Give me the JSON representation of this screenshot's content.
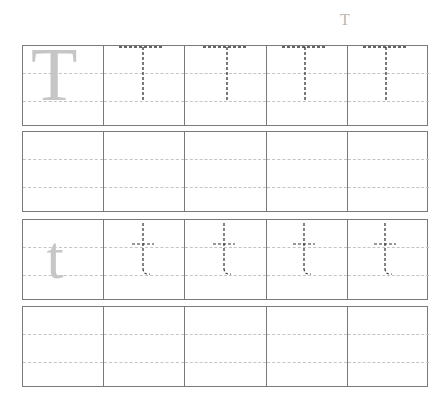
{
  "worksheet": {
    "title_letter": "T",
    "rows": [
      {
        "type": "trace",
        "model_letter": "T",
        "trace_letter": "T",
        "trace_count": 4
      },
      {
        "type": "blank"
      },
      {
        "type": "trace",
        "model_letter": "t",
        "trace_letter": "t",
        "trace_count": 4
      },
      {
        "type": "blank"
      }
    ],
    "colors": {
      "border": "#7a7a7a",
      "guide_line": "#c4c4c4",
      "model_letter": "#c6c6c6",
      "trace_stroke": "#333333"
    }
  }
}
